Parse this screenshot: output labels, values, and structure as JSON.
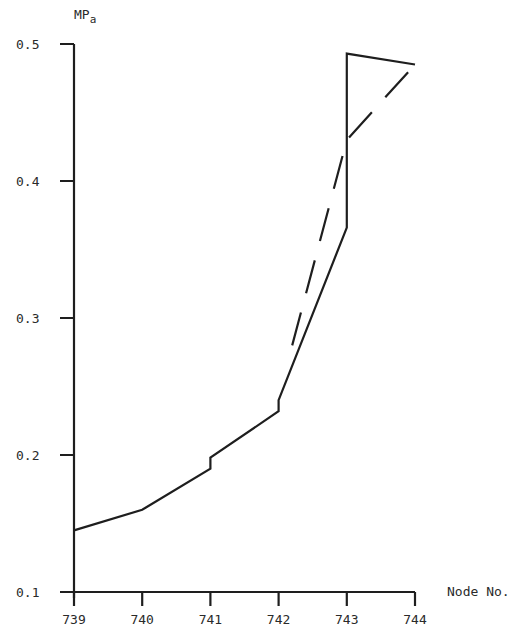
{
  "chart_data": {
    "type": "line",
    "title": "",
    "xlabel": "Node No.",
    "ylabel": "MPa",
    "xlim": [
      739,
      744
    ],
    "ylim": [
      0.1,
      0.5
    ],
    "grid": false,
    "x_ticks": [
      "739",
      "740",
      "741",
      "742",
      "743",
      "744"
    ],
    "y_ticks": [
      "0.1",
      "0.2",
      "0.3",
      "0.4",
      "0.5"
    ],
    "series": [
      {
        "name": "solid",
        "style": "solid",
        "x": [
          739,
          740,
          741,
          741,
          742,
          742,
          743,
          743,
          744
        ],
        "y": [
          0.145,
          0.16,
          0.19,
          0.198,
          0.232,
          0.24,
          0.366,
          0.493,
          0.485
        ]
      },
      {
        "name": "dashed",
        "style": "dashed",
        "x": [
          742.2,
          743,
          744
        ],
        "y": [
          0.28,
          0.43,
          0.485
        ]
      }
    ]
  },
  "labels": {
    "y_unit_main": "MP",
    "y_unit_sub": "a",
    "x_title": "Node No."
  }
}
